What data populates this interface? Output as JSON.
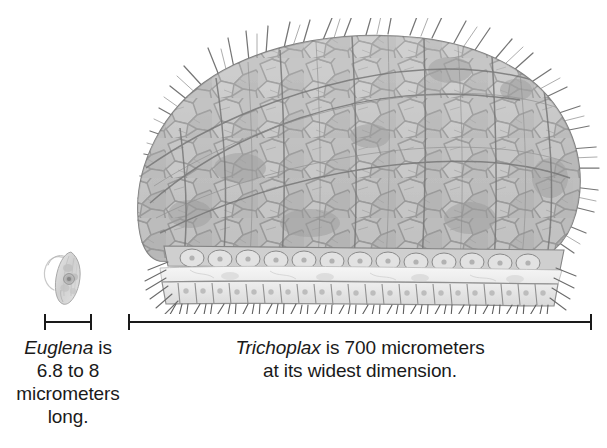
{
  "figure": {
    "background_color": "#ffffff",
    "ink_color": "#1a1a1a",
    "body_gray": "#bfbfbf",
    "body_light_gray": "#dcdcdc",
    "outline_gray": "#8a8a8a"
  },
  "organisms": {
    "euglena": {
      "name": "Euglena",
      "icon": "euglena-cell-illustration",
      "description": "small spindle-shaped single-celled protist with flagellum"
    },
    "trichoplax": {
      "name": "Trichoplax",
      "icon": "trichoplax-cross-section-illustration",
      "description": "dome-shaped multicellular animal cross section with ciliated dorsal epithelium, fiber cell layer and columnar ventral epithelium"
    }
  },
  "scale_bars": {
    "euglena": {
      "label": "euglena-scale-bar",
      "value": "6.8 to 8 micrometers"
    },
    "trichoplax": {
      "label": "trichoplax-scale-bar",
      "value": "700 micrometers"
    }
  },
  "captions": {
    "euglena": {
      "sci_name": "Euglena",
      "line1_rest": " is",
      "line2": "6.8 to 8",
      "line3": "micrometers",
      "line4": "long."
    },
    "trichoplax": {
      "sci_name": "Trichoplax",
      "line1_rest": " is 700 micrometers",
      "line2": "at its widest dimension."
    }
  }
}
